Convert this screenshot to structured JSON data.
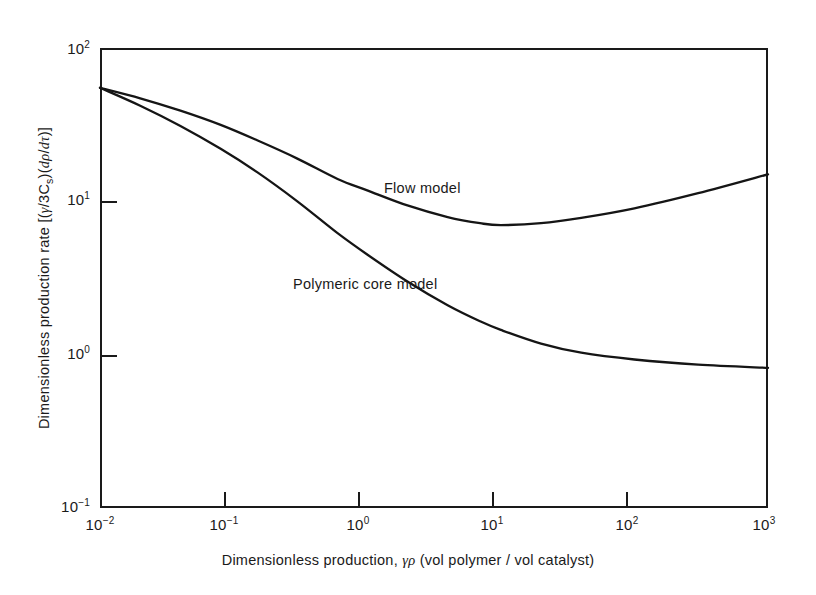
{
  "chart_data": {
    "type": "line",
    "title": "",
    "xlabel": "Dimensionless production, γρ (vol polymer / vol catalyst)",
    "ylabel": "Dimensionless production rate [(γ/3Cₛ)(dρ/dτ)]",
    "xscale": "log",
    "yscale": "log",
    "xlim": [
      0.01,
      1000
    ],
    "ylim": [
      0.1,
      100
    ],
    "grid": false,
    "legend": "inline-annotations",
    "xticks": [
      0.01,
      0.1,
      1,
      10,
      100,
      1000
    ],
    "xticklabels": [
      "10-2",
      "10-1",
      "10 0",
      "10 1",
      "10 2",
      "10 3"
    ],
    "yticks": [
      0.1,
      1,
      10,
      100
    ],
    "yticklabels": [
      "10-1",
      "10 0",
      "10 1",
      "10 2"
    ],
    "series": [
      {
        "name": "Flow model",
        "x": [
          0.01,
          0.02,
          0.04,
          0.08,
          0.15,
          0.3,
          0.6,
          1.0,
          2.0,
          4.0,
          7.0,
          10.0,
          20.0,
          40.0,
          100.0,
          300.0,
          1000.0
        ],
        "y": [
          55.0,
          47.0,
          39.0,
          31.5,
          25.0,
          19.0,
          14.0,
          11.8,
          9.4,
          7.9,
          7.2,
          7.0,
          7.2,
          7.8,
          9.0,
          11.3,
          15.0
        ]
      },
      {
        "name": "Polymeric core model",
        "x": [
          0.01,
          0.02,
          0.04,
          0.08,
          0.15,
          0.3,
          0.6,
          1.0,
          2.0,
          4.0,
          7.0,
          10.0,
          20.0,
          40.0,
          100.0,
          300.0,
          1000.0
        ],
        "y": [
          55.0,
          42.0,
          31.0,
          22.0,
          15.5,
          10.0,
          6.2,
          4.5,
          3.0,
          2.1,
          1.65,
          1.45,
          1.18,
          1.03,
          0.93,
          0.86,
          0.82
        ]
      }
    ],
    "annotations": [
      {
        "text": "Flow model",
        "x": 1.1,
        "y": 12.5
      },
      {
        "text": "Polymeric core model",
        "x": 0.38,
        "y": 3.1
      }
    ]
  },
  "axes": {
    "x": {
      "title_prefix": "Dimensionless production",
      "title_comma": ",",
      "title_symbol": "γρ",
      "title_units": "(vol polymer / vol catalyst)",
      "ticks": [
        {
          "label_mantissa": "10",
          "label_exponent": "−2"
        },
        {
          "label_mantissa": "10",
          "label_exponent": "−1"
        },
        {
          "label_mantissa": "10",
          "label_exponent": "0"
        },
        {
          "label_mantissa": "10",
          "label_exponent": "1"
        },
        {
          "label_mantissa": "10",
          "label_exponent": "2"
        },
        {
          "label_mantissa": "10",
          "label_exponent": "3"
        }
      ]
    },
    "y": {
      "title_prefix": "Dimensionless production rate",
      "title_bracket_open": "[(",
      "title_gamma": "γ",
      "title_slash": "/3",
      "title_cs": "C",
      "title_cs_sub": "s",
      "title_mid": ")(",
      "title_drho": "dρ",
      "title_slash2": "/",
      "title_dtau": "dτ",
      "title_bracket_close": ")]",
      "ticks": [
        {
          "label_mantissa": "10",
          "label_exponent": "2"
        },
        {
          "label_mantissa": "10",
          "label_exponent": "1"
        },
        {
          "label_mantissa": "10",
          "label_exponent": "0"
        },
        {
          "label_mantissa": "10",
          "label_exponent": "−1"
        }
      ]
    }
  },
  "curve_labels": {
    "flow": "Flow model",
    "core": "Polymeric core model"
  },
  "colors": {
    "ink": "#1a1a1a",
    "background": "#ffffff",
    "curve": "#151515"
  }
}
